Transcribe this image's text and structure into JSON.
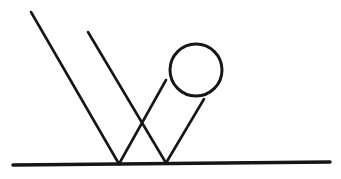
{
  "canvas": {
    "width": 341,
    "height": 179,
    "background_color": "#FFFFFF",
    "title": "Geometric line drawing"
  },
  "style": {
    "ink_color": "#161616",
    "stroke_width_thin": 2.6,
    "stroke_width_baseline": 3.4,
    "circle_stroke_width": 3.0
  },
  "chart_data": {
    "type": "scatter",
    "xlabel": "",
    "ylabel": "",
    "xlim": [
      0,
      341
    ],
    "ylim": [
      0,
      179
    ],
    "grid": false,
    "legend": "none",
    "shapes": [
      {
        "name": "ground-line",
        "kind": "line",
        "x1": 13,
        "y1": 165,
        "x2": 330,
        "y2": 162,
        "stroke_width": 3.4,
        "color": "#161616"
      },
      {
        "name": "incident-ray-left",
        "kind": "line",
        "x1": 31,
        "y1": 12,
        "x2": 119,
        "y2": 164,
        "stroke_width": 2.6,
        "color": "#161616"
      },
      {
        "name": "incident-ray-middle",
        "kind": "line",
        "x1": 88,
        "y1": 32,
        "x2": 166,
        "y2": 163,
        "stroke_width": 2.6,
        "color": "#161616"
      },
      {
        "name": "reflected-ray-left",
        "kind": "line",
        "x1": 119,
        "y1": 164,
        "x2": 166,
        "y2": 80,
        "stroke_width": 2.6,
        "color": "#161616"
      },
      {
        "name": "reflected-ray-right",
        "kind": "line",
        "x1": 166,
        "y1": 163,
        "x2": 204,
        "y2": 99,
        "stroke_width": 2.6,
        "color": "#161616"
      },
      {
        "name": "circle",
        "kind": "circle",
        "cx": 196,
        "cy": 70,
        "r": 26,
        "stroke_width": 3.0,
        "color": "#161616",
        "fill": "none"
      }
    ],
    "vertices": [
      {
        "name": "ground-contact-left",
        "x": 119,
        "y": 164
      },
      {
        "name": "ground-contact-right",
        "x": 166,
        "y": 163
      },
      {
        "name": "ray-crossing",
        "x": 140,
        "y": 124
      }
    ],
    "annotations": []
  }
}
